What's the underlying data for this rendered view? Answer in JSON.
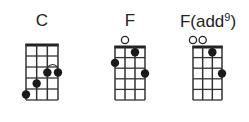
{
  "chords": [
    {
      "name": "C",
      "superscript": "",
      "title_x": 42,
      "grid": {
        "left": 26,
        "top": 45,
        "width": 32,
        "height": 55
      },
      "open_strings": [],
      "dots": [
        {
          "string": 1,
          "fret": 5
        },
        {
          "string": 2,
          "fret": 4
        },
        {
          "string": 3,
          "fret": 3
        },
        {
          "string": 4,
          "fret": 3
        }
      ],
      "barre_arc": {
        "from_string": 3,
        "to_string": 4,
        "fret": 3
      }
    },
    {
      "name": "F",
      "superscript": "",
      "title_x": 130,
      "grid": {
        "left": 115,
        "top": 47,
        "width": 30,
        "height": 53
      },
      "open_strings": [
        2
      ],
      "dots": [
        {
          "string": 1,
          "fret": 2
        },
        {
          "string": 3,
          "fret": 1
        },
        {
          "string": 4,
          "fret": 3
        }
      ]
    },
    {
      "name": "F(add",
      "superscript": "9",
      "suffix": ")",
      "title_x": 208,
      "grid": {
        "left": 193,
        "top": 47,
        "width": 29,
        "height": 53
      },
      "open_strings": [
        1,
        2
      ],
      "dots": [
        {
          "string": 3,
          "fret": 1
        },
        {
          "string": 4,
          "fret": 3
        }
      ]
    }
  ],
  "strings": 4,
  "frets": 5
}
